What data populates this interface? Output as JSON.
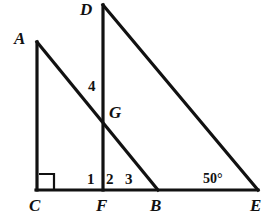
{
  "figure": {
    "background_color": "#ffffff",
    "stroke_color": "#111111",
    "width": 273,
    "height": 222
  },
  "vertices": [
    {
      "name": "A",
      "label": "A",
      "x": 37,
      "y": 42,
      "label_x": 14,
      "label_y": 30
    },
    {
      "name": "D",
      "label": "D",
      "x": 103,
      "y": 5,
      "label_x": 80,
      "label_y": 1
    },
    {
      "name": "G",
      "label": "G",
      "x": 104,
      "y": 116,
      "label_x": 109,
      "label_y": 104
    },
    {
      "name": "C",
      "label": "C",
      "x": 37,
      "y": 190,
      "label_x": 29,
      "label_y": 197
    },
    {
      "name": "F",
      "label": "F",
      "x": 103,
      "y": 190,
      "label_x": 96,
      "label_y": 197
    },
    {
      "name": "B",
      "label": "B",
      "x": 158,
      "y": 190,
      "label_x": 150,
      "label_y": 197
    },
    {
      "name": "E",
      "label": "E",
      "x": 258,
      "y": 190,
      "label_x": 250,
      "label_y": 197
    }
  ],
  "segments": [
    {
      "name": "segment-AC",
      "from": "A",
      "to": "C"
    },
    {
      "name": "segment-AB",
      "from": "A",
      "to": "B"
    },
    {
      "name": "segment-DF",
      "from": "D",
      "to": "F"
    },
    {
      "name": "segment-DE",
      "from": "D",
      "to": "E"
    },
    {
      "name": "segment-CE",
      "from": "C",
      "to": "E"
    }
  ],
  "angle_labels": [
    {
      "name": "angle-4",
      "text": "4",
      "x": 88,
      "y": 79,
      "kind": "number",
      "at_vertex": "G"
    },
    {
      "name": "angle-1",
      "text": "1",
      "x": 87,
      "y": 172,
      "kind": "number",
      "at_vertex": "F"
    },
    {
      "name": "angle-2",
      "text": "2",
      "x": 106,
      "y": 172,
      "kind": "number",
      "at_vertex": "F"
    },
    {
      "name": "angle-3",
      "text": "3",
      "x": 125,
      "y": 172,
      "kind": "number",
      "at_vertex": "B"
    },
    {
      "name": "angle-E",
      "text": "50°",
      "x": 203,
      "y": 172,
      "kind": "measure",
      "at_vertex": "E"
    }
  ],
  "right_angle": {
    "name": "right-angle-mark-C",
    "at_vertex": "C",
    "x": 39,
    "y": 174,
    "size": 15
  }
}
